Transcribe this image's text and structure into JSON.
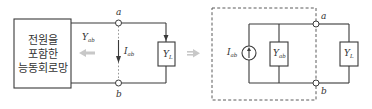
{
  "left_circuit": {
    "network_box": {
      "lines": [
        "전원을",
        "포함한",
        "능동회로망"
      ]
    },
    "admittance_label": {
      "main": "Y",
      "sub": "ab"
    },
    "current_label": {
      "main": "I",
      "sub": "ab"
    },
    "load_label": {
      "main": "Y",
      "sub": "L"
    },
    "terminal_a": "a",
    "terminal_b": "b"
  },
  "transform_arrow": "⇒",
  "right_circuit": {
    "source_label": {
      "main": "I",
      "sub": "ab"
    },
    "admittance_label": {
      "main": "Y",
      "sub": "ab"
    },
    "load_label": {
      "main": "Y",
      "sub": "L"
    },
    "terminal_a": "a",
    "terminal_b": "b"
  },
  "colors": {
    "line": "#3a3a3a",
    "arrow_gray": "#c8c8c8",
    "text": "#333333"
  }
}
